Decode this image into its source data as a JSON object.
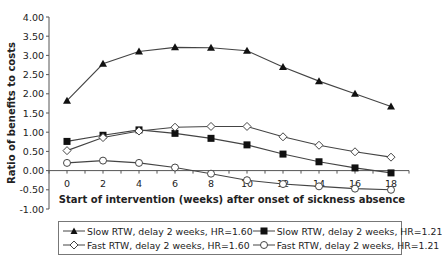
{
  "chart_data": {
    "type": "line",
    "title": "",
    "xlabel": "Start of intervention (weeks) after onset of sickness absence",
    "ylabel": "Ratio of benefits to costs",
    "x": [
      0,
      2,
      4,
      6,
      8,
      10,
      12,
      14,
      16,
      18
    ],
    "x_tick_labels": [
      "0",
      "2",
      "4",
      "6",
      "8",
      "10",
      "12",
      "14",
      "16",
      "18"
    ],
    "y_tick_labels": [
      "4.00",
      "3.50",
      "3.00",
      "2.50",
      "2.00",
      "1.50",
      "1.00",
      "0.50",
      "0.00",
      "-0.50",
      "-1.00"
    ],
    "ylim": [
      -1.0,
      4.0
    ],
    "xlim": [
      0,
      18
    ],
    "grid": false,
    "legend_position": "bottom",
    "series": [
      {
        "name": "Slow RTW, delay 2 weeks, HR=1.60",
        "marker": "triangle-filled",
        "values": [
          1.82,
          2.78,
          3.1,
          3.21,
          3.2,
          3.12,
          2.7,
          2.33,
          2.0,
          1.67
        ]
      },
      {
        "name": "Slow RTW, delay 2 weeks, HR=1.21",
        "marker": "square-filled",
        "values": [
          0.76,
          0.92,
          1.06,
          0.97,
          0.84,
          0.67,
          0.43,
          0.23,
          0.07,
          -0.06
        ]
      },
      {
        "name": "Fast RTW, delay 2 weeks, HR=1.60",
        "marker": "diamond-open",
        "values": [
          0.52,
          0.86,
          1.03,
          1.13,
          1.15,
          1.15,
          0.88,
          0.66,
          0.49,
          0.35
        ]
      },
      {
        "name": "Fast RTW, delay 2 weeks, HR=1.21",
        "marker": "circle-open",
        "values": [
          0.2,
          0.26,
          0.2,
          0.08,
          -0.08,
          -0.25,
          -0.35,
          -0.41,
          -0.47,
          -0.5
        ]
      }
    ]
  },
  "legend": {
    "items": [
      {
        "label": "Slow RTW, delay 2 weeks, HR=1.60",
        "marker": "triangle-icon"
      },
      {
        "label": "Slow RTW, delay 2 weeks, HR=1.21",
        "marker": "square-icon"
      },
      {
        "label": "Fast RTW, delay 2 weeks, HR=1.60",
        "marker": "diamond-icon"
      },
      {
        "label": "Fast RTW, delay 2 weeks, HR=1.21",
        "marker": "circle-icon"
      }
    ]
  },
  "colors": {
    "line": "#444444",
    "marker_fill": "#111111",
    "axis": "#555555"
  }
}
